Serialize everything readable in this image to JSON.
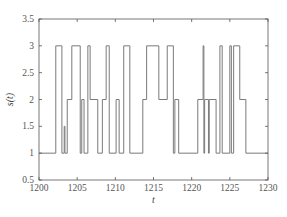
{
  "chart_data": {
    "type": "line",
    "style": "step",
    "title": "",
    "xlabel": "t",
    "ylabel": "s(t)",
    "xlim": [
      1200,
      1230
    ],
    "ylim": [
      0.5,
      3.5
    ],
    "xticks": [
      1200,
      1205,
      1210,
      1215,
      1220,
      1225,
      1230
    ],
    "yticks": [
      0.5,
      1,
      1.5,
      2,
      2.5,
      3,
      3.5
    ],
    "xtick_labels": [
      "1200",
      "1205",
      "1210",
      "1215",
      "1220",
      "1225",
      "1230"
    ],
    "ytick_labels": [
      "0.5",
      "1",
      "1.5",
      "2",
      "2.5",
      "3",
      "3.5"
    ],
    "grid": false,
    "legend": null,
    "series": [
      {
        "name": "s(t)",
        "color": "#7a7a7a",
        "points": [
          [
            1200.0,
            1
          ],
          [
            1202.2,
            3
          ],
          [
            1203.0,
            1
          ],
          [
            1203.3,
            1.5
          ],
          [
            1203.4,
            1
          ],
          [
            1203.7,
            2
          ],
          [
            1204.3,
            3
          ],
          [
            1205.4,
            1
          ],
          [
            1205.6,
            2
          ],
          [
            1205.9,
            1
          ],
          [
            1206.4,
            3
          ],
          [
            1206.7,
            2
          ],
          [
            1207.7,
            1
          ],
          [
            1208.3,
            2
          ],
          [
            1208.8,
            3
          ],
          [
            1209.2,
            1
          ],
          [
            1210.1,
            2
          ],
          [
            1210.5,
            1
          ],
          [
            1211.1,
            3
          ],
          [
            1211.9,
            1
          ],
          [
            1213.6,
            2
          ],
          [
            1214.1,
            3
          ],
          [
            1215.7,
            2
          ],
          [
            1216.8,
            3
          ],
          [
            1217.6,
            1
          ],
          [
            1217.8,
            2
          ],
          [
            1218.3,
            1
          ],
          [
            1220.8,
            2
          ],
          [
            1221.5,
            3
          ],
          [
            1221.6,
            1
          ],
          [
            1221.7,
            2
          ],
          [
            1222.2,
            1
          ],
          [
            1222.3,
            2
          ],
          [
            1223.2,
            1
          ],
          [
            1223.7,
            3
          ],
          [
            1224.0,
            1
          ],
          [
            1225.0,
            3
          ],
          [
            1225.2,
            1
          ],
          [
            1225.5,
            3
          ],
          [
            1226.3,
            2
          ],
          [
            1227.1,
            1
          ],
          [
            1230.0,
            1
          ]
        ]
      }
    ]
  },
  "colors": {
    "axis": "#555555",
    "line": "#7a7a7a",
    "background": "#ffffff"
  },
  "plot_area": {
    "left": 39,
    "top": 19,
    "right": 268,
    "bottom": 180
  }
}
